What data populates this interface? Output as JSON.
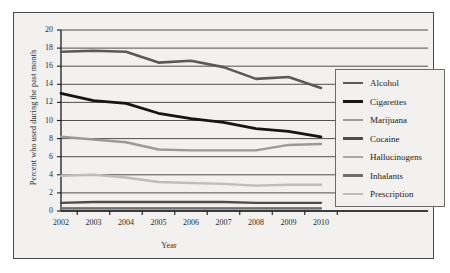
{
  "chart_data": {
    "type": "line",
    "title": "",
    "xlabel": "Year",
    "ylabel": "Percent who used during the past month",
    "x": [
      2002,
      2003,
      2004,
      2005,
      2006,
      2007,
      2008,
      2009,
      2010
    ],
    "categories": [
      "2002",
      "2003",
      "2004",
      "2005",
      "2006",
      "2007",
      "2008",
      "2009",
      "2010"
    ],
    "xlim": [
      2002,
      2010
    ],
    "ylim": [
      0,
      20
    ],
    "yticks": [
      "0",
      "2",
      "4",
      "6",
      "8",
      "10",
      "12",
      "14",
      "16",
      "18",
      "20"
    ],
    "ytick_values": [
      0,
      2,
      4,
      6,
      8,
      10,
      12,
      14,
      16,
      18,
      20
    ],
    "grid": "horizontal",
    "legend_position": "right",
    "series": [
      {
        "name": "Alcohol",
        "color": "#595959",
        "width": 2.6,
        "values": [
          17.6,
          17.7,
          17.6,
          16.4,
          16.6,
          15.9,
          14.6,
          14.8,
          13.6
        ]
      },
      {
        "name": "Cigarettes",
        "color": "#151515",
        "width": 2.8,
        "values": [
          13.0,
          12.2,
          11.9,
          10.8,
          10.2,
          9.8,
          9.1,
          8.8,
          8.2
        ]
      },
      {
        "name": "Marijuana",
        "color": "#9a9a9a",
        "width": 2.4,
        "values": [
          8.2,
          7.9,
          7.6,
          6.8,
          6.7,
          6.7,
          6.7,
          7.3,
          7.4
        ]
      },
      {
        "name": "Cocaine",
        "color": "#4d4d4d",
        "width": 2.4,
        "values": [
          0.9,
          1.0,
          1.0,
          1.0,
          1.0,
          1.0,
          0.9,
          0.9,
          0.9
        ]
      },
      {
        "name": "Hallucinogens",
        "color": "#a8a8a8",
        "width": 2.2,
        "values": [
          0.3,
          0.3,
          0.3,
          0.3,
          0.3,
          0.3,
          0.3,
          0.3,
          0.3
        ]
      },
      {
        "name": "Inhalants",
        "color": "#6e6e6e",
        "width": 2.2,
        "values": [
          0.3,
          0.3,
          0.3,
          0.3,
          0.3,
          0.3,
          0.3,
          0.3,
          0.3
        ]
      },
      {
        "name": "Prescription",
        "color": "#bdbdbd",
        "width": 2.4,
        "values": [
          3.9,
          4.0,
          3.7,
          3.2,
          3.1,
          3.0,
          2.8,
          2.9,
          2.9
        ]
      }
    ],
    "axis_color": "#1b1b1b",
    "grid_color": "#3d3d3d",
    "background": "#f2f1ef"
  }
}
